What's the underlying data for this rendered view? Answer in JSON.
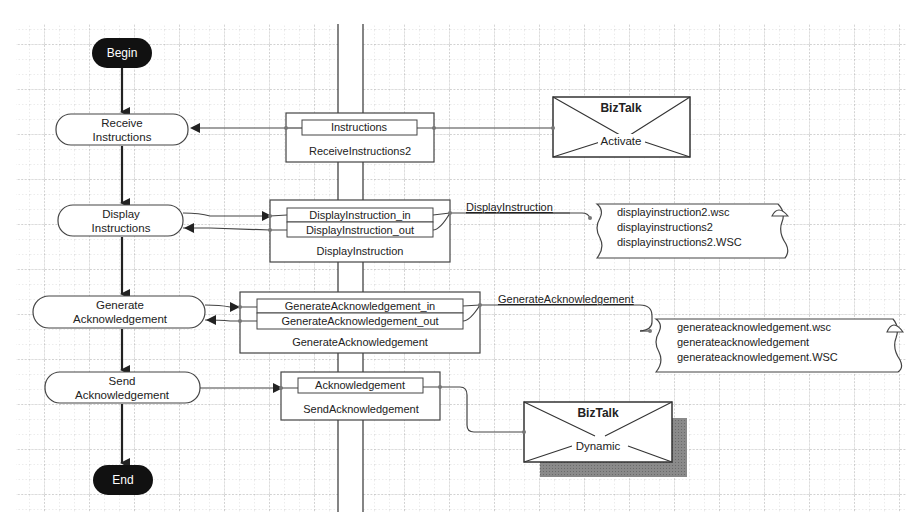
{
  "diagram": {
    "type": "BizTalk Orchestration flowchart",
    "colors": {
      "background": "#ffffff",
      "grid": "#b8b8b8",
      "stroke": "#333333",
      "terminal_fill": "#111111",
      "terminal_text": "#ffffff",
      "shadow": "#7a7a7a"
    },
    "flow": {
      "begin": "Begin",
      "end": "End",
      "steps": [
        {
          "line1": "Receive",
          "line2": "Instructions"
        },
        {
          "line1": "Display",
          "line2": "Instructions"
        },
        {
          "line1": "Generate",
          "line2": "Acknowledgement"
        },
        {
          "line1": "Send",
          "line2": "Acknowledgement"
        }
      ]
    },
    "ports": [
      {
        "name": "ReceiveInstructions2",
        "messages": [
          "Instructions"
        ]
      },
      {
        "name": "DisplayInstruction",
        "messages": [
          "DisplayInstruction_in",
          "DisplayInstruction_out"
        ]
      },
      {
        "name": "GenerateAcknowledgement",
        "messages": [
          "GenerateAcknowledgement_in",
          "GenerateAcknowledgement_out"
        ]
      },
      {
        "name": "SendAcknowledgement",
        "messages": [
          "Acknowledgement"
        ]
      }
    ],
    "bindings": [
      {
        "title": "BizTalk",
        "subtitle": "Activate"
      },
      {
        "title": "BizTalk",
        "subtitle": "Dynamic"
      }
    ],
    "connections": [
      {
        "label": "DisplayInstruction"
      },
      {
        "label": "GenerateAcknowledgement"
      }
    ],
    "components": [
      {
        "lines": [
          "displayinstruction2.wsc",
          "displayinstructions2",
          "displayinstructions2.WSC"
        ]
      },
      {
        "lines": [
          "generateacknowledgement.wsc",
          "generateacknowledgement",
          "generateacknowledgement.WSC"
        ]
      }
    ]
  }
}
